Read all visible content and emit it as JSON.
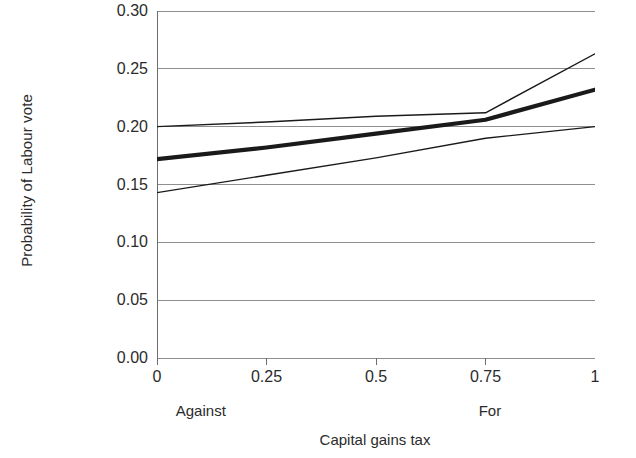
{
  "chart_data": {
    "type": "line",
    "title": "",
    "xlabel": "Capital gains tax",
    "ylabel": "Probability of Labour vote",
    "xlim": [
      0,
      1
    ],
    "ylim": [
      0.0,
      0.3
    ],
    "grid": true,
    "legend_position": "none",
    "x_ticks": [
      "0",
      "0.25",
      "0.5",
      "0.75",
      "1"
    ],
    "x_tick_values": [
      0,
      0.25,
      0.5,
      0.75,
      1
    ],
    "y_ticks": [
      "0.00",
      "0.05",
      "0.10",
      "0.15",
      "0.20",
      "0.25",
      "0.30"
    ],
    "y_tick_values": [
      0.0,
      0.05,
      0.1,
      0.15,
      0.2,
      0.25,
      0.3
    ],
    "x_anchor_labels": [
      {
        "text": "Against",
        "x": 0.1
      },
      {
        "text": "For",
        "x": 0.76
      }
    ],
    "x": [
      0,
      0.25,
      0.5,
      0.75,
      1
    ],
    "series": [
      {
        "name": "Upper confidence bound",
        "style": "thin",
        "values": [
          0.2,
          0.204,
          0.209,
          0.212,
          0.263
        ]
      },
      {
        "name": "Predicted probability",
        "style": "thick",
        "values": [
          0.172,
          0.182,
          0.194,
          0.206,
          0.232
        ]
      },
      {
        "name": "Lower confidence bound",
        "style": "thin",
        "values": [
          0.143,
          0.158,
          0.173,
          0.19,
          0.2
        ]
      }
    ]
  },
  "axis_title_y": "Probability of Labour vote",
  "axis_title_x": "Capital gains tax",
  "colors": {
    "line": "#1a1a1a",
    "grid": "#8e8e8e",
    "axis": "#6e6e6e",
    "text": "#2b2b2b",
    "background": "#ffffff"
  }
}
